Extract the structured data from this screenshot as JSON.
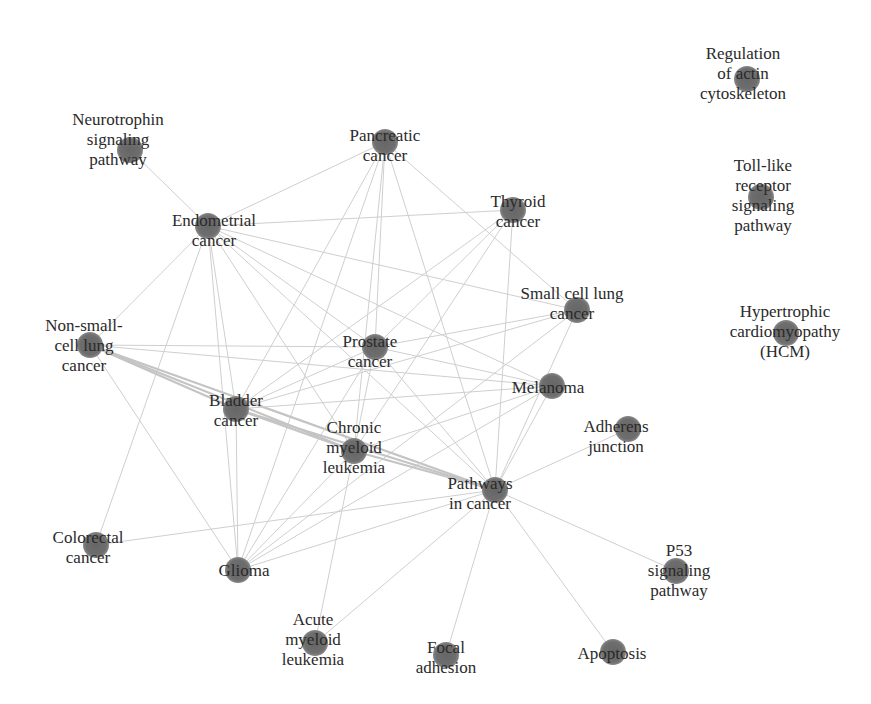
{
  "diagram": {
    "type": "network",
    "title": "",
    "node_color": "#6b6b6b",
    "edge_color": "#cfcfcf",
    "background": "#ffffff",
    "nodes": [
      {
        "id": "neurotrophin",
        "lines": [
          "Neurotrophin",
          "signaling",
          "pathway"
        ],
        "x": 130,
        "y": 150,
        "lx": 118,
        "ly": 110
      },
      {
        "id": "endometrial",
        "lines": [
          "Endometrial",
          "cancer"
        ],
        "x": 208,
        "y": 226,
        "lx": 214,
        "ly": 211
      },
      {
        "id": "pancreatic",
        "lines": [
          "Pancreatic",
          "cancer"
        ],
        "x": 385,
        "y": 142,
        "lx": 385,
        "ly": 126
      },
      {
        "id": "thyroid",
        "lines": [
          "Thyroid",
          "cancer"
        ],
        "x": 513,
        "y": 210,
        "lx": 518,
        "ly": 192
      },
      {
        "id": "small_cell",
        "lines": [
          "Small cell lung",
          "cancer"
        ],
        "x": 577,
        "y": 310,
        "lx": 572,
        "ly": 284
      },
      {
        "id": "non_small_cell",
        "lines": [
          "Non-small-",
          "cell lung",
          "cancer"
        ],
        "x": 90,
        "y": 345,
        "lx": 84,
        "ly": 316
      },
      {
        "id": "prostate",
        "lines": [
          "Prostate",
          "cancer"
        ],
        "x": 375,
        "y": 347,
        "lx": 370,
        "ly": 332
      },
      {
        "id": "melanoma",
        "lines": [
          "Melanoma"
        ],
        "x": 552,
        "y": 386,
        "lx": 548,
        "ly": 378
      },
      {
        "id": "adherens",
        "lines": [
          "Adherens",
          "junction"
        ],
        "x": 628,
        "y": 429,
        "lx": 616,
        "ly": 417
      },
      {
        "id": "bladder",
        "lines": [
          "Bladder",
          "cancer"
        ],
        "x": 236,
        "y": 409,
        "lx": 236,
        "ly": 391
      },
      {
        "id": "cml",
        "lines": [
          "Chronic",
          "myeloid",
          "leukemia"
        ],
        "x": 354,
        "y": 451,
        "lx": 354,
        "ly": 418
      },
      {
        "id": "pathways_cancer",
        "lines": [
          "Pathways",
          "in cancer"
        ],
        "x": 495,
        "y": 490,
        "lx": 480,
        "ly": 474
      },
      {
        "id": "colorectal",
        "lines": [
          "Colorectal",
          "cancer"
        ],
        "x": 96,
        "y": 545,
        "lx": 88,
        "ly": 528
      },
      {
        "id": "glioma",
        "lines": [
          "Glioma"
        ],
        "x": 238,
        "y": 570,
        "lx": 244,
        "ly": 561
      },
      {
        "id": "p53",
        "lines": [
          "P53",
          "signaling",
          "pathway"
        ],
        "x": 676,
        "y": 571,
        "lx": 679,
        "ly": 541
      },
      {
        "id": "aml",
        "lines": [
          "Acute",
          "myeloid",
          "leukemia"
        ],
        "x": 315,
        "y": 643,
        "lx": 313,
        "ly": 610
      },
      {
        "id": "focal",
        "lines": [
          "Focal",
          "adhesion"
        ],
        "x": 446,
        "y": 655,
        "lx": 446,
        "ly": 638
      },
      {
        "id": "apoptosis",
        "lines": [
          "Apoptosis"
        ],
        "x": 613,
        "y": 652,
        "lx": 612,
        "ly": 644
      },
      {
        "id": "actin",
        "lines": [
          "Regulation",
          "of actin",
          "cytoskeleton"
        ],
        "x": 747,
        "y": 79,
        "lx": 743,
        "ly": 44
      },
      {
        "id": "tlr",
        "lines": [
          "Toll-like",
          "receptor",
          "signaling",
          "pathway"
        ],
        "x": 761,
        "y": 197,
        "lx": 763,
        "ly": 156
      },
      {
        "id": "hcm",
        "lines": [
          "Hypertrophic",
          "cardiomyopathy",
          "(HCM)"
        ],
        "x": 786,
        "y": 333,
        "lx": 785,
        "ly": 302
      }
    ],
    "edges": [
      [
        "neurotrophin",
        "endometrial",
        1
      ],
      [
        "endometrial",
        "pancreatic",
        1
      ],
      [
        "endometrial",
        "thyroid",
        1
      ],
      [
        "endometrial",
        "non_small_cell",
        1
      ],
      [
        "endometrial",
        "bladder",
        1
      ],
      [
        "endometrial",
        "prostate",
        1
      ],
      [
        "endometrial",
        "cml",
        1
      ],
      [
        "endometrial",
        "melanoma",
        1
      ],
      [
        "endometrial",
        "pathways_cancer",
        1
      ],
      [
        "endometrial",
        "glioma",
        1
      ],
      [
        "endometrial",
        "colorectal",
        1
      ],
      [
        "endometrial",
        "small_cell",
        1
      ],
      [
        "pancreatic",
        "bladder",
        1
      ],
      [
        "pancreatic",
        "prostate",
        1
      ],
      [
        "pancreatic",
        "cml",
        1
      ],
      [
        "pancreatic",
        "pathways_cancer",
        1
      ],
      [
        "pancreatic",
        "small_cell",
        1
      ],
      [
        "pancreatic",
        "glioma",
        1
      ],
      [
        "thyroid",
        "prostate",
        1
      ],
      [
        "thyroid",
        "bladder",
        1
      ],
      [
        "thyroid",
        "pathways_cancer",
        1
      ],
      [
        "thyroid",
        "cml",
        1
      ],
      [
        "small_cell",
        "prostate",
        1
      ],
      [
        "small_cell",
        "bladder",
        1
      ],
      [
        "small_cell",
        "pathways_cancer",
        1
      ],
      [
        "small_cell",
        "glioma",
        1
      ],
      [
        "non_small_cell",
        "prostate",
        1
      ],
      [
        "non_small_cell",
        "melanoma",
        1
      ],
      [
        "non_small_cell",
        "bladder",
        2
      ],
      [
        "non_small_cell",
        "cml",
        2
      ],
      [
        "non_small_cell",
        "pathways_cancer",
        2
      ],
      [
        "non_small_cell",
        "glioma",
        1
      ],
      [
        "prostate",
        "bladder",
        1
      ],
      [
        "prostate",
        "cml",
        1
      ],
      [
        "prostate",
        "melanoma",
        1
      ],
      [
        "prostate",
        "pathways_cancer",
        1
      ],
      [
        "prostate",
        "glioma",
        1
      ],
      [
        "melanoma",
        "bladder",
        1
      ],
      [
        "melanoma",
        "cml",
        1
      ],
      [
        "melanoma",
        "pathways_cancer",
        1
      ],
      [
        "melanoma",
        "glioma",
        1
      ],
      [
        "adherens",
        "pathways_cancer",
        1
      ],
      [
        "bladder",
        "cml",
        2
      ],
      [
        "bladder",
        "pathways_cancer",
        2
      ],
      [
        "bladder",
        "glioma",
        1
      ],
      [
        "cml",
        "pathways_cancer",
        2
      ],
      [
        "cml",
        "glioma",
        1
      ],
      [
        "cml",
        "aml",
        1
      ],
      [
        "pathways_cancer",
        "colorectal",
        1
      ],
      [
        "pathways_cancer",
        "glioma",
        1
      ],
      [
        "pathways_cancer",
        "p53",
        1
      ],
      [
        "pathways_cancer",
        "aml",
        1
      ],
      [
        "pathways_cancer",
        "focal",
        1
      ],
      [
        "pathways_cancer",
        "apoptosis",
        1
      ]
    ]
  }
}
